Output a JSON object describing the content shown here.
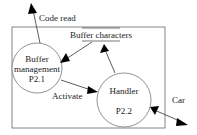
{
  "diagram": {
    "type": "data-flow-diagram",
    "colors": {
      "stroke": "#555555",
      "text": "#1a1a1a",
      "arrow": "#000000",
      "background": "#ffffff"
    },
    "processes": [
      {
        "id": "p21",
        "name_line1": "Buffer",
        "name_line2": "management",
        "number": "P2.1"
      },
      {
        "id": "p22",
        "name": "Handler",
        "number": "P2.2"
      }
    ],
    "data_store": {
      "label": "Buffer characters"
    },
    "flows": [
      {
        "label": "Code read",
        "from": "Buffer management",
        "to": "external"
      },
      {
        "label": "",
        "from": "Buffer characters",
        "to": "Buffer management"
      },
      {
        "label": "",
        "from": "Handler",
        "to": "Buffer characters"
      },
      {
        "label": "Activate",
        "from": "Buffer management",
        "to": "Handler"
      },
      {
        "label": "Car",
        "between": [
          "Handler",
          "external"
        ],
        "bidirectional": true
      }
    ]
  }
}
